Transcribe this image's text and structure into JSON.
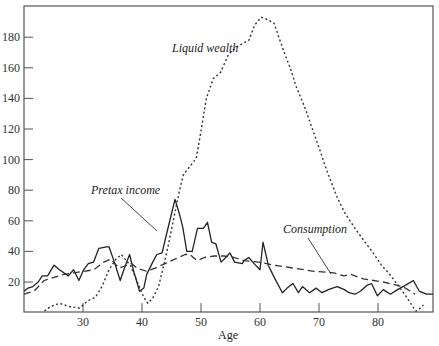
{
  "chart_data": {
    "type": "line",
    "title": "",
    "ylabel": "Thousands of 1990 dollars",
    "xlabel": "Age",
    "xlim": [
      20,
      90
    ],
    "ylim": [
      2,
      198
    ],
    "x_ticks": [
      30,
      40,
      50,
      60,
      70,
      80
    ],
    "y_ticks": [
      20,
      40,
      60,
      80,
      100,
      120,
      140,
      160,
      180
    ],
    "grid": false,
    "legend": "inline labels",
    "series": [
      {
        "name": "Pretax income",
        "style": "solid",
        "points": [
          [
            20.0,
            14
          ],
          [
            20.7,
            16
          ],
          [
            21.5,
            17
          ],
          [
            22.4,
            20
          ],
          [
            23.1,
            24
          ],
          [
            24.0,
            24
          ],
          [
            25.1,
            31
          ],
          [
            26.0,
            28
          ],
          [
            27.5,
            24
          ],
          [
            28.4,
            28
          ],
          [
            29.3,
            21
          ],
          [
            30.1,
            28
          ],
          [
            30.9,
            32
          ],
          [
            31.8,
            33
          ],
          [
            32.7,
            42
          ],
          [
            34.0,
            43
          ],
          [
            34.4,
            43
          ],
          [
            35.4,
            32
          ],
          [
            36.3,
            21
          ],
          [
            37.1,
            30
          ],
          [
            37.9,
            38
          ],
          [
            38.6,
            27
          ],
          [
            39.6,
            14
          ],
          [
            40.3,
            16
          ],
          [
            40.8,
            25
          ],
          [
            41.7,
            32
          ],
          [
            42.5,
            38
          ],
          [
            43.4,
            39
          ],
          [
            44.2,
            52
          ],
          [
            45.6,
            74
          ],
          [
            46.3,
            65
          ],
          [
            46.9,
            56
          ],
          [
            47.6,
            40
          ],
          [
            48.5,
            40
          ],
          [
            49.4,
            55
          ],
          [
            50.4,
            55
          ],
          [
            51.1,
            59
          ],
          [
            51.8,
            46
          ],
          [
            52.5,
            45
          ],
          [
            53.4,
            33
          ],
          [
            54.2,
            36
          ],
          [
            54.9,
            39
          ],
          [
            55.7,
            33
          ],
          [
            57.0,
            32
          ],
          [
            57.3,
            34
          ],
          [
            58.1,
            36
          ],
          [
            59.0,
            32
          ],
          [
            60.0,
            28
          ],
          [
            60.5,
            46
          ],
          [
            61.4,
            31
          ],
          [
            62.4,
            23
          ],
          [
            63.8,
            13
          ],
          [
            64.6,
            16
          ],
          [
            65.6,
            19
          ],
          [
            66.5,
            13
          ],
          [
            67.2,
            17
          ],
          [
            68.4,
            13
          ],
          [
            69.5,
            16
          ],
          [
            70.5,
            13
          ],
          [
            71.6,
            15
          ],
          [
            72.3,
            16
          ],
          [
            73.1,
            17
          ],
          [
            74.3,
            15
          ],
          [
            75.1,
            13
          ],
          [
            76.1,
            12
          ],
          [
            77.0,
            14
          ],
          [
            78.2,
            18
          ],
          [
            78.9,
            19
          ],
          [
            79.9,
            11
          ],
          [
            80.9,
            15
          ],
          [
            82.1,
            12
          ],
          [
            83.3,
            15
          ],
          [
            84.7,
            18
          ],
          [
            86.0,
            21
          ],
          [
            87.0,
            14
          ],
          [
            88.2,
            12
          ],
          [
            89.5,
            12
          ],
          [
            90.0,
            16
          ]
        ]
      },
      {
        "name": "Consumption",
        "style": "dashed",
        "points": [
          [
            20.0,
            12
          ],
          [
            21.7,
            14
          ],
          [
            23.4,
            21
          ],
          [
            25.1,
            23
          ],
          [
            26.8,
            25
          ],
          [
            28.4,
            26
          ],
          [
            30.1,
            27
          ],
          [
            31.8,
            28
          ],
          [
            33.5,
            33
          ],
          [
            34.7,
            35
          ],
          [
            36.1,
            29
          ],
          [
            38.2,
            32
          ],
          [
            39.2,
            29
          ],
          [
            40.8,
            27
          ],
          [
            42.2,
            29
          ],
          [
            43.9,
            32
          ],
          [
            45.6,
            35
          ],
          [
            47.3,
            38
          ],
          [
            48.1,
            38
          ],
          [
            49.3,
            34
          ],
          [
            50.6,
            36
          ],
          [
            52.2,
            37
          ],
          [
            53.9,
            37
          ],
          [
            55.6,
            36
          ],
          [
            57.3,
            34
          ],
          [
            59.8,
            33
          ],
          [
            62.4,
            31
          ],
          [
            65.8,
            29
          ],
          [
            69.2,
            27
          ],
          [
            72.5,
            26
          ],
          [
            74.2,
            24
          ],
          [
            75.4,
            25
          ],
          [
            77.5,
            22
          ],
          [
            80.9,
            20
          ],
          [
            84.2,
            17
          ],
          [
            86.3,
            12
          ]
        ]
      },
      {
        "name": "Liquid wealth",
        "style": "dotted",
        "points": [
          [
            20.0,
            -4
          ],
          [
            22.0,
            -3
          ],
          [
            24.5,
            4
          ],
          [
            26.0,
            6
          ],
          [
            27.7,
            4
          ],
          [
            29.4,
            3
          ],
          [
            30.9,
            8
          ],
          [
            32.1,
            10
          ],
          [
            33.2,
            17
          ],
          [
            34.4,
            28
          ],
          [
            35.6,
            35
          ],
          [
            36.5,
            38
          ],
          [
            37.3,
            34
          ],
          [
            38.0,
            31
          ],
          [
            39.0,
            22
          ],
          [
            40.3,
            10
          ],
          [
            41.0,
            6
          ],
          [
            41.9,
            10
          ],
          [
            42.8,
            17
          ],
          [
            43.7,
            31
          ],
          [
            44.5,
            45
          ],
          [
            45.4,
            62
          ],
          [
            46.3,
            79
          ],
          [
            47.0,
            90
          ],
          [
            48.0,
            95
          ],
          [
            49.2,
            101
          ],
          [
            50.1,
            121
          ],
          [
            50.9,
            140
          ],
          [
            52.1,
            153
          ],
          [
            53.3,
            157
          ],
          [
            54.7,
            169
          ],
          [
            56.2,
            174
          ],
          [
            58.1,
            178
          ],
          [
            59.1,
            188
          ],
          [
            60.2,
            193
          ],
          [
            61.0,
            192
          ],
          [
            62.4,
            189
          ],
          [
            63.1,
            181
          ],
          [
            64.2,
            169
          ],
          [
            65.3,
            158
          ],
          [
            66.1,
            148
          ],
          [
            67.5,
            135
          ],
          [
            68.7,
            122
          ],
          [
            69.9,
            109
          ],
          [
            71.3,
            93
          ],
          [
            73.0,
            76
          ],
          [
            74.4,
            65
          ],
          [
            76.1,
            55
          ],
          [
            77.8,
            46
          ],
          [
            79.0,
            40
          ],
          [
            80.6,
            31
          ],
          [
            82.2,
            24
          ],
          [
            84.7,
            11
          ],
          [
            86.4,
            1
          ],
          [
            86.9,
            2
          ],
          [
            87.7,
            5
          ]
        ]
      }
    ],
    "annotations": [
      {
        "text": "Liquid wealth",
        "x": 47.5,
        "y": 170
      },
      {
        "text": "Pretax income",
        "x": 31.8,
        "y": 78
      },
      {
        "text": "Consumption",
        "x": 68.5,
        "y": 53
      }
    ]
  },
  "labels": {
    "unit": "Thousands of 1990 dollars",
    "x_axis_title": "Age",
    "liquid_wealth": "Liquid wealth",
    "pretax_income": "Pretax income",
    "consumption": "Consumption"
  }
}
